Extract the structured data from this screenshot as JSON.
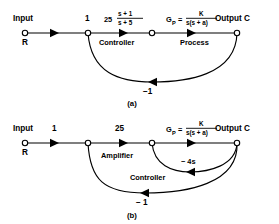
{
  "figure": {
    "type": "signal-flow-graph",
    "background": "#ffffff",
    "ink": "#000000",
    "diagrams": [
      {
        "id": "a",
        "caption": "(a)",
        "input_label": "Input",
        "input_node_label": "R",
        "output_label": "Output C",
        "nodes": [
          {
            "name": "input-node",
            "x": 25,
            "y": 33
          },
          {
            "name": "summing-node",
            "x": 88,
            "y": 33
          },
          {
            "name": "mid-node",
            "x": 152,
            "y": 33
          },
          {
            "name": "output-node",
            "x": 237,
            "y": 33
          }
        ],
        "branches": [
          {
            "name": "input-branch",
            "gain": "1",
            "block_label": ""
          },
          {
            "name": "controller-branch",
            "gain_coefficient": "25",
            "gain_numerator": "s + 1",
            "gain_denominator": "s + 5",
            "block_label": "Controller"
          },
          {
            "name": "process-branch",
            "gain_symbol": "G",
            "gain_subscript": "P",
            "gain_equals": "=",
            "gain_numerator": "K",
            "gain_denominator": "s(s + a)",
            "block_label": "Process"
          }
        ],
        "feedback": [
          {
            "name": "unity-feedback",
            "gain": "−1",
            "from": "output-node",
            "to": "summing-node"
          }
        ]
      },
      {
        "id": "b",
        "caption": "(b)",
        "input_label": "Input",
        "input_node_label": "R",
        "output_label": "Output C",
        "nodes": [
          {
            "name": "input-node",
            "x": 25,
            "y": 143
          },
          {
            "name": "summing-node",
            "x": 88,
            "y": 143
          },
          {
            "name": "mid-node",
            "x": 152,
            "y": 143
          },
          {
            "name": "output-node",
            "x": 237,
            "y": 143
          }
        ],
        "branches": [
          {
            "name": "input-branch",
            "gain": "1",
            "block_label": ""
          },
          {
            "name": "amplifier-branch",
            "gain": "25",
            "block_label": "Amplifier"
          },
          {
            "name": "process-branch",
            "gain_symbol": "G",
            "gain_subscript": "P",
            "gain_equals": "=",
            "gain_numerator": "K",
            "gain_denominator": "s(s + a)",
            "block_label": ""
          }
        ],
        "feedback": [
          {
            "name": "rate-feedback",
            "gain": "− 4s",
            "block_label": "Controller",
            "from": "output-node",
            "to": "mid-node"
          },
          {
            "name": "unity-feedback",
            "gain": "− 1",
            "from": "output-node",
            "to": "summing-node"
          }
        ]
      }
    ]
  }
}
